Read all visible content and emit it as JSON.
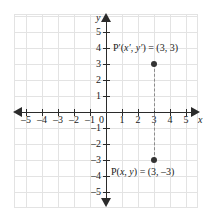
{
  "figure": {
    "type": "coordinate-plane",
    "title": "",
    "background_color": "#ffffff",
    "grid_color": "#e3e3e3",
    "axis_color": "#2b2b2b",
    "point_color": "#333333",
    "connector_color": "#8c8c8c"
  },
  "axes": {
    "x": {
      "name": "x",
      "min": -5,
      "max": 5,
      "tick_labels": [
        "-5",
        "-4",
        "-3",
        "-2",
        "-1",
        "1",
        "2",
        "3",
        "4",
        "5"
      ],
      "tick_values": [
        -5,
        -4,
        -3,
        -2,
        -1,
        1,
        2,
        3,
        4,
        5
      ]
    },
    "y": {
      "name": "y",
      "min": -5,
      "max": 5,
      "tick_labels": [
        "5",
        "4",
        "3",
        "2",
        "1",
        "-1",
        "-2",
        "-3",
        "-4",
        "-5"
      ],
      "tick_values": [
        5,
        4,
        3,
        2,
        1,
        -1,
        -2,
        -3,
        -4,
        -5
      ]
    },
    "origin_label": "0"
  },
  "chart_data": {
    "type": "scatter",
    "title": "",
    "xlabel": "x",
    "ylabel": "y",
    "xlim": [
      -5,
      5
    ],
    "ylim": [
      -5,
      5
    ],
    "grid": true,
    "points": [
      {
        "name": "P-prime",
        "x": 3,
        "y": 3,
        "label": "P′(x′, y′) = (3, 3)"
      },
      {
        "name": "P",
        "x": 3,
        "y": -3,
        "label": "P(x, y) = (3, –3)"
      }
    ],
    "annotations": [
      {
        "type": "dashed-segment",
        "from": [
          3,
          3
        ],
        "to": [
          3,
          -3
        ]
      }
    ]
  },
  "labels": {
    "p_prime": {
      "prefix": "P′(",
      "var1": "x′",
      "sep": ", ",
      "var2": "y′",
      "suffix": ") = (3, 3)",
      "full": "P′(x′, y′) = (3, 3)"
    },
    "p": {
      "prefix": "P(",
      "var1": "x",
      "sep": ", ",
      "var2": "y",
      "suffix": ") = (3, –3)",
      "full": "P(x, y) = (3, –3)"
    }
  }
}
